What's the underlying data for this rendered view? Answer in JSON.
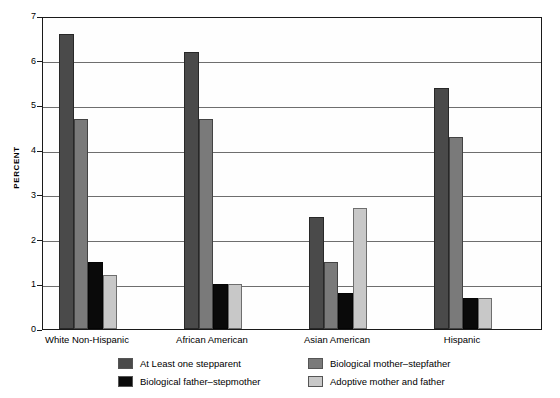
{
  "chart_data": {
    "type": "bar",
    "title": "",
    "subtitle": "",
    "xlabel": "",
    "ylabel": "PERCENT",
    "ylim": [
      0,
      7
    ],
    "yticks": [
      0,
      1,
      2,
      3,
      4,
      5,
      6,
      7
    ],
    "ytick_labels": [
      "0",
      "1",
      "2",
      "3",
      "4",
      "5",
      "6",
      "7"
    ],
    "grid": true,
    "grid_axis": "y",
    "legend_position": "bottom",
    "legend_columns": 2,
    "categories": [
      "White Non-Hispanic",
      "African American",
      "Asian American",
      "Hispanic"
    ],
    "series": [
      {
        "name": "At Least one stepparent",
        "color": "#4a4a4a",
        "values": [
          6.6,
          6.2,
          2.5,
          5.4
        ]
      },
      {
        "name": "Biological mother–stepfather",
        "color": "#7a7a7a",
        "values": [
          4.7,
          4.7,
          1.5,
          4.3
        ]
      },
      {
        "name": "Biological father–stepmother",
        "color": "#0a0a0a",
        "values": [
          1.5,
          1.0,
          0.8,
          0.7
        ]
      },
      {
        "name": "Adoptive mother and father",
        "color": "#c8c8c8",
        "values": [
          1.2,
          1.0,
          2.7,
          0.7
        ]
      }
    ]
  },
  "colors": {
    "axis": "#1a1a1a",
    "grid": "#6e6e6e",
    "background": "#ffffff",
    "plot_background": "#fefefe"
  }
}
